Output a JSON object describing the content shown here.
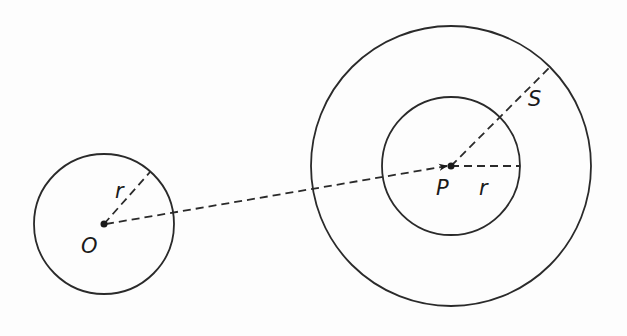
{
  "diagram": {
    "labels": {
      "origin": "O",
      "point": "P",
      "small_radius_left": "r",
      "small_radius_right": "r",
      "large_radius": "S"
    },
    "colors": {
      "stroke": "#2a2a2a",
      "background": "#fdfdfd"
    },
    "geometry": {
      "circle_O": {
        "cx": 104,
        "cy": 224,
        "r": 70
      },
      "circle_P_inner": {
        "cx": 451,
        "cy": 166,
        "r": 69
      },
      "circle_P_outer": {
        "cx": 451,
        "cy": 166,
        "r": 140
      }
    }
  }
}
